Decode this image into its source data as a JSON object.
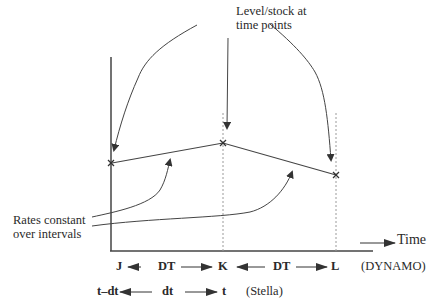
{
  "title": {
    "line1": "Level/stock at",
    "line2": "time points"
  },
  "rates_label": {
    "line1": "Rates constant",
    "line2": "over intervals"
  },
  "axis": {
    "x_label": "Time"
  },
  "dynamo_row": {
    "start": "J",
    "interval1": "DT",
    "mid": "K",
    "interval2": "DT",
    "end": "L",
    "system": "(DYNAMO)"
  },
  "stella_row": {
    "start": "t–dt",
    "interval": "dt",
    "end": "t",
    "system": "(Stella)"
  },
  "points": [
    {
      "label": "x",
      "name": "J"
    },
    {
      "label": "x",
      "name": "K"
    },
    {
      "label": "x",
      "name": "L"
    }
  ],
  "colors": {
    "line": "#444444",
    "dashed": "#9a9a9a",
    "text": "#2a2a2a"
  }
}
